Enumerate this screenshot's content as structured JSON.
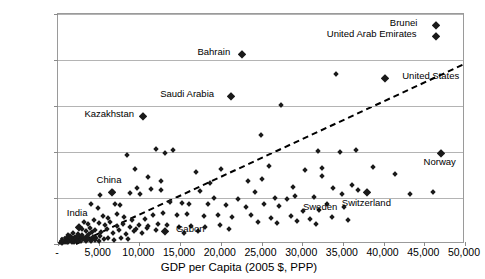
{
  "chart_data": {
    "type": "scatter",
    "title": "",
    "xlabel": "GDP per Capita (2005 $, PPP)",
    "ylabel": "CO2 Emissions per Capita (Metric Tons)",
    "ylabel_parts": {
      "pre": "CO",
      "sub": "2",
      "post": "Emissions per Capita (Metric Tons)"
    },
    "xlim": [
      0,
      50000
    ],
    "ylim": [
      0,
      25
    ],
    "xticks": [
      "-",
      "5,000",
      "10,000",
      "15,000",
      "20,000",
      "25,000",
      "30,000",
      "35,000",
      "40,000",
      "45,000",
      "50,000"
    ],
    "xtick_values": [
      0,
      5000,
      10000,
      15000,
      20000,
      25000,
      30000,
      35000,
      40000,
      45000,
      50000
    ],
    "yticks": [
      "-",
      "5.0",
      "10.0",
      "15.0",
      "20.0",
      "25.0"
    ],
    "ytick_values": [
      0,
      5,
      10,
      15,
      20,
      25
    ],
    "grid": "horizontal",
    "legend": "none",
    "trendline": {
      "style": "dashed",
      "color": "#000000",
      "x0": 2200,
      "y0": 0.0,
      "x1": 50000,
      "y1": 19.6
    },
    "annotations": [
      {
        "label": "Brunei",
        "x": 44700,
        "y": 23.8,
        "side": "left"
      },
      {
        "label": "United Arab Emirates",
        "x": 44700,
        "y": 22.6,
        "side": "left"
      },
      {
        "label": "Bahrain",
        "x": 21800,
        "y": 20.6,
        "side": "left"
      },
      {
        "label": "United States",
        "x": 41800,
        "y": 18.0,
        "side": "right"
      },
      {
        "label": "Saudi Arabia",
        "x": 19800,
        "y": 16.1,
        "side": "left"
      },
      {
        "label": "Kazakhstan",
        "x": 10000,
        "y": 13.9,
        "side": "left"
      },
      {
        "label": "Norway",
        "x": 47000,
        "y": 9.9,
        "side": "below"
      },
      {
        "label": "China",
        "x": 6400,
        "y": 5.7,
        "side": "above"
      },
      {
        "label": "Switzerland",
        "x": 38000,
        "y": 5.4,
        "side": "below"
      },
      {
        "label": "Sweden",
        "x": 32300,
        "y": 5.0,
        "side": "below"
      },
      {
        "label": "India",
        "x": 2500,
        "y": 2.1,
        "side": "above"
      },
      {
        "label": "Gabon",
        "x": 14000,
        "y": 1.4,
        "side": "right"
      }
    ],
    "labeled_points": [
      {
        "name": "Brunei",
        "x": 46400,
        "y": 23.8
      },
      {
        "name": "United Arab Emirates",
        "x": 46400,
        "y": 22.6
      },
      {
        "name": "Bahrain",
        "x": 22600,
        "y": 20.6
      },
      {
        "name": "United States",
        "x": 40200,
        "y": 18.0
      },
      {
        "name": "Saudi Arabia",
        "x": 21200,
        "y": 16.1
      },
      {
        "name": "Kazakhstan",
        "x": 10400,
        "y": 13.9
      },
      {
        "name": "Norway",
        "x": 47000,
        "y": 9.9
      },
      {
        "name": "China",
        "x": 6600,
        "y": 5.6
      },
      {
        "name": "Switzerland",
        "x": 38000,
        "y": 5.6
      },
      {
        "name": "Sweden",
        "x": 32300,
        "y": 5.0
      },
      {
        "name": "India",
        "x": 2600,
        "y": 1.9
      },
      {
        "name": "Gabon",
        "x": 13100,
        "y": 1.4
      }
    ],
    "points": [
      [
        46400,
        23.8
      ],
      [
        46400,
        22.6
      ],
      [
        22600,
        20.6
      ],
      [
        21200,
        16.1
      ],
      [
        34200,
        18.5
      ],
      [
        40200,
        18.0
      ],
      [
        27400,
        15.1
      ],
      [
        10400,
        13.9
      ],
      [
        31900,
        10.1
      ],
      [
        34700,
        10.0
      ],
      [
        14100,
        10.2
      ],
      [
        47000,
        9.9
      ],
      [
        36600,
        10.2
      ],
      [
        8500,
        9.7
      ],
      [
        20000,
        8.2
      ],
      [
        9500,
        8.1
      ],
      [
        13100,
        9.9
      ],
      [
        16900,
        7.8
      ],
      [
        24900,
        11.9
      ],
      [
        12100,
        10.3
      ],
      [
        30300,
        8.0
      ],
      [
        25900,
        8.5
      ],
      [
        32400,
        8.3
      ],
      [
        32400,
        7.4
      ],
      [
        38700,
        8.4
      ],
      [
        41400,
        7.6
      ],
      [
        28900,
        6.2
      ],
      [
        36100,
        6.4
      ],
      [
        6600,
        5.6
      ],
      [
        6800,
        5.7
      ],
      [
        5200,
        5.3
      ],
      [
        9700,
        6.1
      ],
      [
        11400,
        6.0
      ],
      [
        12600,
        5.9
      ],
      [
        17400,
        5.8
      ],
      [
        24200,
        5.7
      ],
      [
        29100,
        5.2
      ],
      [
        31400,
        5.1
      ],
      [
        34900,
        5.4
      ],
      [
        38000,
        5.6
      ],
      [
        43300,
        5.4
      ],
      [
        46100,
        5.6
      ],
      [
        8800,
        5.5
      ],
      [
        10100,
        5.4
      ],
      [
        19200,
        5.0
      ],
      [
        22100,
        4.9
      ],
      [
        26700,
        5.0
      ],
      [
        28100,
        4.9
      ],
      [
        4100,
        4.3
      ],
      [
        4900,
        3.9
      ],
      [
        7000,
        4.4
      ],
      [
        7600,
        4.2
      ],
      [
        13700,
        4.6
      ],
      [
        15200,
        4.5
      ],
      [
        16100,
        4.3
      ],
      [
        18400,
        4.4
      ],
      [
        20700,
        4.2
      ],
      [
        23100,
        4.0
      ],
      [
        25300,
        4.4
      ],
      [
        27100,
        4.1
      ],
      [
        33100,
        4.3
      ],
      [
        35100,
        4.0
      ],
      [
        30100,
        3.6
      ],
      [
        32100,
        3.7
      ],
      [
        11700,
        3.2
      ],
      [
        12900,
        3.4
      ],
      [
        14600,
        3.1
      ],
      [
        15800,
        3.3
      ],
      [
        17900,
        3.0
      ],
      [
        19600,
        3.2
      ],
      [
        21400,
        2.9
      ],
      [
        23700,
        3.1
      ],
      [
        26200,
        2.8
      ],
      [
        28600,
        3.0
      ],
      [
        30900,
        2.7
      ],
      [
        33600,
        2.9
      ],
      [
        5500,
        3.0
      ],
      [
        6100,
        2.8
      ],
      [
        7300,
        3.3
      ],
      [
        8100,
        2.9
      ],
      [
        9100,
        2.6
      ],
      [
        10700,
        2.7
      ],
      [
        3200,
        2.4
      ],
      [
        3700,
        2.2
      ],
      [
        4400,
        2.6
      ],
      [
        5000,
        2.3
      ],
      [
        5800,
        2.1
      ],
      [
        6400,
        2.4
      ],
      [
        7200,
        2.0
      ],
      [
        8000,
        2.2
      ],
      [
        8900,
        1.9
      ],
      [
        9900,
        2.1
      ],
      [
        11100,
        2.0
      ],
      [
        12300,
        2.2
      ],
      [
        13100,
        1.4
      ],
      [
        13400,
        2.1
      ],
      [
        14900,
        1.9
      ],
      [
        16400,
        2.0
      ],
      [
        18100,
        1.8
      ],
      [
        19900,
        2.1
      ],
      [
        2600,
        1.9
      ],
      [
        2900,
        1.6
      ],
      [
        3400,
        1.4
      ],
      [
        3900,
        1.7
      ],
      [
        4600,
        1.5
      ],
      [
        5300,
        1.3
      ],
      [
        6000,
        1.6
      ],
      [
        6700,
        1.2
      ],
      [
        7500,
        1.5
      ],
      [
        8300,
        1.1
      ],
      [
        9300,
        1.4
      ],
      [
        10300,
        1.2
      ],
      [
        1200,
        1.0
      ],
      [
        1500,
        0.9
      ],
      [
        1800,
        1.2
      ],
      [
        2100,
        0.8
      ],
      [
        2400,
        1.1
      ],
      [
        2700,
        0.7
      ],
      [
        3000,
        1.0
      ],
      [
        3300,
        0.6
      ],
      [
        3600,
        0.9
      ],
      [
        4000,
        0.5
      ],
      [
        4300,
        0.8
      ],
      [
        4700,
        0.6
      ],
      [
        5100,
        0.9
      ],
      [
        5600,
        0.5
      ],
      [
        6200,
        0.7
      ],
      [
        6900,
        0.4
      ],
      [
        7700,
        0.6
      ],
      [
        8600,
        0.5
      ],
      [
        400,
        0.3
      ],
      [
        550,
        0.5
      ],
      [
        700,
        0.2
      ],
      [
        850,
        0.6
      ],
      [
        1000,
        0.4
      ],
      [
        1150,
        0.7
      ],
      [
        1300,
        0.3
      ],
      [
        1450,
        0.5
      ],
      [
        1600,
        0.8
      ],
      [
        1750,
        0.4
      ],
      [
        1900,
        0.6
      ],
      [
        2050,
        0.3
      ],
      [
        2200,
        0.7
      ],
      [
        2350,
        0.5
      ],
      [
        2500,
        0.9
      ],
      [
        2650,
        0.4
      ],
      [
        2800,
        0.6
      ],
      [
        2950,
        0.8
      ],
      [
        300,
        0.15
      ],
      [
        450,
        0.25
      ],
      [
        600,
        0.1
      ],
      [
        750,
        0.35
      ],
      [
        900,
        0.2
      ],
      [
        1050,
        0.45
      ],
      [
        1200,
        0.15
      ],
      [
        1350,
        0.3
      ],
      [
        1500,
        0.55
      ],
      [
        1650,
        0.25
      ],
      [
        1800,
        0.4
      ],
      [
        1950,
        0.2
      ],
      [
        2100,
        0.5
      ],
      [
        2250,
        0.3
      ],
      [
        2400,
        0.6
      ],
      [
        2550,
        0.35
      ],
      [
        2700,
        0.45
      ],
      [
        2850,
        0.25
      ],
      [
        3100,
        0.4
      ],
      [
        3400,
        0.3
      ],
      [
        3700,
        0.55
      ],
      [
        4100,
        0.35
      ],
      [
        4500,
        0.45
      ],
      [
        5000,
        0.3
      ],
      [
        200,
        0.1
      ],
      [
        350,
        0.2
      ],
      [
        500,
        0.05
      ],
      [
        650,
        0.3
      ],
      [
        800,
        0.12
      ],
      [
        950,
        0.22
      ],
      [
        1100,
        0.08
      ],
      [
        1250,
        0.35
      ],
      [
        1400,
        0.18
      ],
      [
        1550,
        0.28
      ],
      [
        1700,
        0.1
      ],
      [
        1850,
        0.32
      ],
      [
        2000,
        0.15
      ],
      [
        2150,
        0.25
      ],
      [
        2300,
        0.38
      ],
      [
        2450,
        0.2
      ],
      [
        3800,
        1.1
      ],
      [
        4200,
        1.3
      ],
      [
        9600,
        1.6
      ],
      [
        10900,
        1.7
      ],
      [
        12000,
        1.5
      ],
      [
        15500,
        1.2
      ],
      [
        17200,
        1.4
      ],
      [
        21000,
        1.6
      ],
      [
        24600,
        2.4
      ],
      [
        26900,
        2.3
      ],
      [
        29400,
        2.5
      ],
      [
        31700,
        2.2
      ],
      [
        35600,
        2.6
      ],
      [
        23400,
        6.8
      ],
      [
        25100,
        7.1
      ],
      [
        11000,
        7.3
      ],
      [
        12700,
        6.9
      ],
      [
        18700,
        6.6
      ],
      [
        33800,
        6.1
      ],
      [
        36900,
        5.9
      ]
    ]
  }
}
